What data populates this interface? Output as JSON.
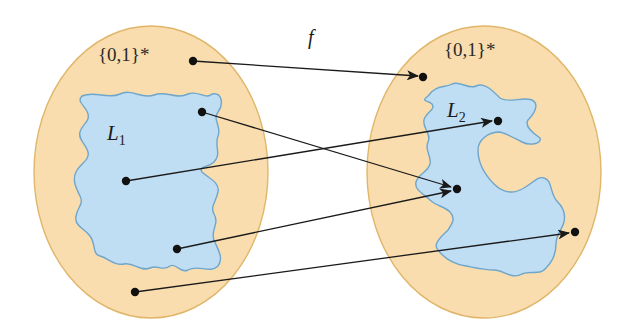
{
  "diagram": {
    "function_label": "f",
    "colors": {
      "universe_fill": "#F9DDAE",
      "universe_stroke": "#E0B66A",
      "language_fill": "#BFDDF3",
      "language_stroke": "#6FA6CB",
      "point": "#111111",
      "arrow": "#1a1a1a"
    },
    "left_set": {
      "universe_label": "{0,1}*",
      "language_label": "L",
      "language_subscript": "1"
    },
    "right_set": {
      "universe_label": "{0,1}*",
      "language_label": "L",
      "language_subscript": "2"
    },
    "mappings": [
      {
        "from": "left point outside L1 (top)",
        "to": "right point outside L2 (top)"
      },
      {
        "from": "left point in L1 (upper right)",
        "to": "right point in L2 (middle)"
      },
      {
        "from": "left point in L1 (center)",
        "to": "right point in L2 (upper)"
      },
      {
        "from": "left point in L1 (lower)",
        "to": "right point in L2 (middle)"
      },
      {
        "from": "left point outside L1 (bottom)",
        "to": "right point outside L2 (right)"
      }
    ]
  }
}
